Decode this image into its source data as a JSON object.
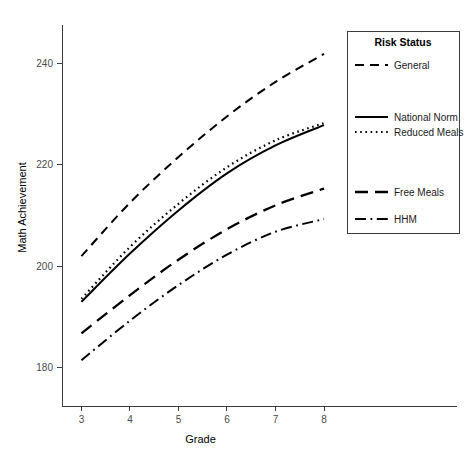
{
  "chart_data": {
    "type": "line",
    "title": "",
    "xlabel": "Grade",
    "ylabel": "Math Achievement",
    "x": [
      3,
      4,
      5,
      6,
      7,
      8
    ],
    "xlim": [
      2.6,
      8.35
    ],
    "ylim": [
      172.5,
      247.5
    ],
    "xticks": [
      "3",
      "4",
      "5",
      "6",
      "7",
      "8"
    ],
    "yticks": [
      "180",
      "200",
      "220",
      "240"
    ],
    "ytick_values": [
      180,
      200,
      220,
      240
    ],
    "grid": false,
    "legend_position": "right",
    "legend_title": "Risk Status",
    "series": [
      {
        "name": "General",
        "dash": "dashed",
        "values": [
          202.0,
          212.5,
          221.5,
          229.5,
          236.3,
          241.8
        ]
      },
      {
        "name": "National Norm",
        "dash": "solid",
        "values": [
          193.0,
          202.5,
          211.0,
          218.3,
          223.8,
          227.8
        ]
      },
      {
        "name": "Reduced Meals",
        "dash": "dotted",
        "values": [
          193.6,
          203.8,
          212.3,
          219.5,
          224.8,
          228.2
        ]
      },
      {
        "name": "Free Meals",
        "dash": "long-dash",
        "values": [
          186.8,
          194.3,
          201.3,
          207.3,
          212.0,
          215.3
        ]
      },
      {
        "name": "HHM",
        "dash": "dash-dot",
        "values": [
          181.5,
          189.3,
          196.3,
          202.3,
          206.8,
          209.3
        ]
      }
    ]
  },
  "axes": {
    "x_title": "Grade",
    "y_title": "Math Achievement"
  },
  "legend": {
    "title": "Risk Status",
    "items": [
      {
        "label": "General"
      },
      {
        "label": "National Norm"
      },
      {
        "label": "Reduced Meals"
      },
      {
        "label": "Free Meals"
      },
      {
        "label": "HHM"
      }
    ]
  }
}
